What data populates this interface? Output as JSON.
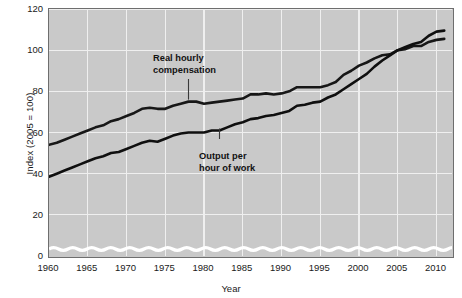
{
  "chart_data": {
    "type": "line",
    "title": "",
    "xlabel": "Year",
    "ylabel": "Index (2005 = 100)",
    "xlim": [
      1960,
      2012
    ],
    "ylim": [
      0,
      120
    ],
    "yticks": [
      0,
      20,
      40,
      60,
      80,
      100,
      120
    ],
    "ytick_labels": [
      "0",
      "20",
      "40",
      "60",
      "80",
      "100",
      "120"
    ],
    "xticks": [
      1960,
      1965,
      1970,
      1975,
      1980,
      1985,
      1990,
      1995,
      2000,
      2005,
      2010
    ],
    "xtick_labels": [
      "1960",
      "1965",
      "1970",
      "1975",
      "1980",
      "1985",
      "1990",
      "1995",
      "2000",
      "2005",
      "2010"
    ],
    "grid": true,
    "grid_color": "#efefef",
    "panel_color": "#c9c9c9",
    "axis_break": true,
    "axis_break_note": "wavy white break band near y=6 indicating truncated axis",
    "legend": "inline-annotations",
    "series": [
      {
        "name": "Real hourly compensation",
        "color": "#171717",
        "x": [
          1960,
          1961,
          1962,
          1963,
          1964,
          1965,
          1966,
          1967,
          1968,
          1969,
          1970,
          1971,
          1972,
          1973,
          1974,
          1975,
          1976,
          1977,
          1978,
          1979,
          1980,
          1981,
          1982,
          1983,
          1984,
          1985,
          1986,
          1987,
          1988,
          1989,
          1990,
          1991,
          1992,
          1993,
          1994,
          1995,
          1996,
          1997,
          1998,
          1999,
          2000,
          2001,
          2002,
          2003,
          2004,
          2005,
          2006,
          2007,
          2008,
          2009,
          2010,
          2011
        ],
        "values": [
          54,
          55,
          56.5,
          58,
          59.5,
          61,
          62.5,
          63.5,
          65.5,
          66.5,
          68,
          69.5,
          71.5,
          72,
          71.5,
          71.5,
          73,
          74,
          75,
          75,
          74,
          74.5,
          75,
          75.5,
          76,
          76.5,
          78.5,
          78.5,
          79,
          78.5,
          79,
          80,
          82,
          82,
          82,
          82,
          83,
          84.5,
          88,
          90,
          92.5,
          94,
          96,
          97.5,
          98,
          100,
          100.5,
          102,
          102,
          104,
          105,
          105.5
        ]
      },
      {
        "name": "Output per hour of work",
        "color": "#0f0f0f",
        "x": [
          1960,
          1961,
          1962,
          1963,
          1964,
          1965,
          1966,
          1967,
          1968,
          1969,
          1970,
          1971,
          1972,
          1973,
          1974,
          1975,
          1976,
          1977,
          1978,
          1979,
          1980,
          1981,
          1982,
          1983,
          1984,
          1985,
          1986,
          1987,
          1988,
          1989,
          1990,
          1991,
          1992,
          1993,
          1994,
          1995,
          1996,
          1997,
          1998,
          1999,
          2000,
          2001,
          2002,
          2003,
          2004,
          2005,
          2006,
          2007,
          2008,
          2009,
          2010,
          2011
        ],
        "values": [
          38.5,
          40,
          41.5,
          43,
          44.5,
          46,
          47.5,
          48.5,
          50,
          50.5,
          52,
          53.5,
          55,
          56,
          55.5,
          57,
          58.5,
          59.5,
          60,
          60,
          60,
          61,
          61,
          62.5,
          64,
          65,
          66.5,
          67,
          68,
          68.5,
          69.5,
          70.5,
          73,
          73.5,
          74.5,
          75,
          77,
          78.5,
          81,
          83.5,
          86,
          88.5,
          92,
          95,
          97.5,
          100,
          101.5,
          103,
          104,
          107,
          109,
          109.5
        ]
      }
    ],
    "annotations": [
      {
        "text_line1": "Real hourly",
        "text_line2": "compensation",
        "points_to_year": 1978,
        "points_to_value": 75
      },
      {
        "text_line1": "Output per",
        "text_line2": "hour of work",
        "points_to_year": 1982,
        "points_to_value": 61
      }
    ]
  }
}
